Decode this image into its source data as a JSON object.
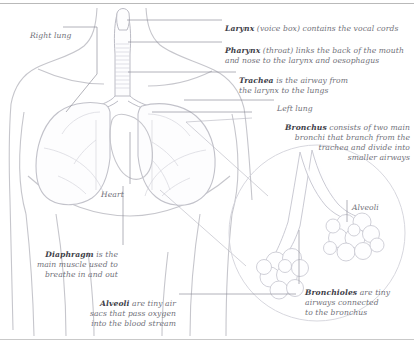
{
  "diagram": {
    "frame_color": "#b9b9b9",
    "line_color": "#7b7b86",
    "text_color": "#6f6f78",
    "bold_color": "#3d3d47"
  },
  "labels": {
    "right_lung": {
      "term": "Right lung",
      "text": "",
      "align": "left"
    },
    "larynx": {
      "term": "Larynx",
      "text": " (voice box) contains the vocal cords",
      "align": "left"
    },
    "pharynx": {
      "term": "Pharynx",
      "text": " (throat) links the back of  the mouth\nand nose to the larynx and oesophagus",
      "align": "left"
    },
    "trachea": {
      "term": "Trachea",
      "text": " is the airway from\nthe larynx to the lungs",
      "align": "left"
    },
    "left_lung": {
      "term": "Left lung",
      "text": "",
      "align": "left"
    },
    "bronchus": {
      "term": "Bronchus",
      "text": " consists of  two main\nbronchi that branch from the\ntrachea and divide into\nsmaller airways",
      "align": "right"
    },
    "heart": {
      "term": "Heart",
      "text": "",
      "align": "left"
    },
    "diaphragm": {
      "term": "Diaphragm",
      "text": " is the\nmain muscle used to\nbreathe in and out",
      "align": "right"
    },
    "alveoli_lower": {
      "term": "Alveoli",
      "text": " are tiny air\nsacs that pass oxygen\ninto the blood stream",
      "align": "right"
    },
    "alveoli_inset": {
      "term": "Alveoli",
      "text": "",
      "align": "left"
    },
    "bronchioles": {
      "term": "Bronchioles",
      "text": " are tiny\nairways connected\nto the bronchus",
      "align": "left"
    }
  }
}
